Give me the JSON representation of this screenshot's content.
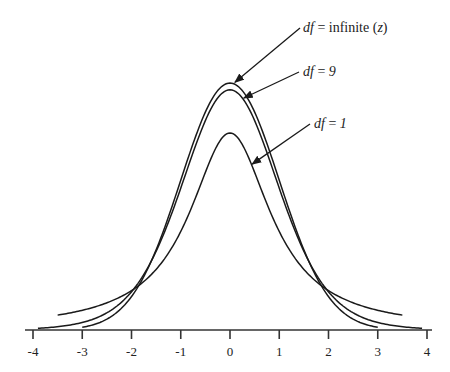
{
  "chart_data": {
    "type": "line",
    "title": "",
    "xlabel": "",
    "ylabel": "",
    "xlim": [
      -4,
      4
    ],
    "ylim": [
      0,
      0.4
    ],
    "grid": false,
    "x_ticks": [
      -4,
      -3,
      -2,
      -1,
      0,
      1,
      2,
      3,
      4
    ],
    "x_tick_labels": [
      "-4",
      "-3",
      "-2",
      "-1",
      "0",
      "1",
      "2",
      "3",
      "4"
    ],
    "series": [
      {
        "name": "df = infinite (z)",
        "distribution": "normal",
        "df": null,
        "x_range": [
          -3,
          3
        ],
        "peak": 0.399
      },
      {
        "name": "df = 9",
        "distribution": "t",
        "df": 9,
        "x_range": [
          -3.9,
          3.9
        ],
        "peak": 0.388
      },
      {
        "name": "df = 1",
        "distribution": "t",
        "df": 1,
        "x_range": [
          -3.5,
          3.5
        ],
        "peak": 0.318
      }
    ],
    "annotations": [
      {
        "target": "df = infinite (z)",
        "italic_part": "df",
        "rest": " = infinite (",
        "var": "z",
        "close": ")",
        "point_x": 0.1,
        "arrow": true
      },
      {
        "target": "df = 9",
        "italic_part": "df",
        "rest": " = ",
        "var": "9",
        "close": "",
        "point_x": 0.28,
        "arrow": true
      },
      {
        "target": "df = 1",
        "italic_part": "df",
        "rest": " = ",
        "var": "1",
        "close": "",
        "point_x": 0.45,
        "arrow": true
      }
    ]
  }
}
